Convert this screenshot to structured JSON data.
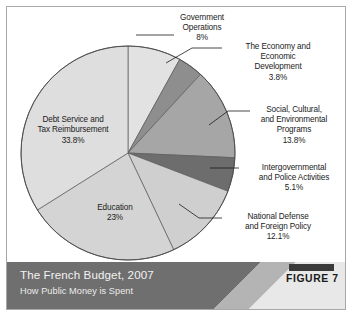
{
  "figure": {
    "title": "The French Budget, 2007",
    "subtitle": "How Public Money is Spent",
    "figure_label": "FIGURE 7"
  },
  "chart_data": {
    "type": "pie",
    "title": "The French Budget, 2007",
    "subtitle": "How Public Money is Spent",
    "legend": "none",
    "grid": false,
    "units": "percent of total budget",
    "categories": [
      "Government Operations",
      "The Economy and Economic Development",
      "Social, Cultural, and Environmental Programs",
      "Intergovernmental and Police Activities",
      "National Defense and Foreign Policy",
      "Education",
      "Debt Service and Tax Reimbursement"
    ],
    "values": [
      8,
      3.8,
      13.8,
      5.1,
      12.1,
      23,
      33.8
    ],
    "value_labels": [
      "8%",
      "3.8%",
      "13.8%",
      "5.1%",
      "12.1%",
      "23%",
      "33.8%"
    ],
    "colors": [
      "#e2e2e2",
      "#8e8e8e",
      "#a6a6a6",
      "#6d6d6d",
      "#cfcfcf",
      "#d4d4d4",
      "#dedede"
    ],
    "slices": [
      {
        "name": "Government Operations",
        "label_lines": "Government\nOperations\n8%",
        "value": 8,
        "value_label": "8%",
        "color": "#e2e2e2",
        "label_placement": "outside-top"
      },
      {
        "name": "The Economy and Economic Development",
        "label_lines": "The Economy and\nEconomic\nDevelopment\n3.8%",
        "value": 3.8,
        "value_label": "3.8%",
        "color": "#8e8e8e",
        "label_placement": "outside-right"
      },
      {
        "name": "Social, Cultural, and Environmental Programs",
        "label_lines": "Social, Cultural,\nand Environmental\nPrograms\n13.8%",
        "value": 13.8,
        "value_label": "13.8%",
        "color": "#a6a6a6",
        "label_placement": "outside-right"
      },
      {
        "name": "Intergovernmental and Police Activities",
        "label_lines": "Intergovernmental\nand Police Activities\n5.1%",
        "value": 5.1,
        "value_label": "5.1%",
        "color": "#6d6d6d",
        "label_placement": "outside-right"
      },
      {
        "name": "National Defense and Foreign Policy",
        "label_lines": "National Defense\nand Foreign Policy\n12.1%",
        "value": 12.1,
        "value_label": "12.1%",
        "color": "#cfcfcf",
        "label_placement": "outside-right"
      },
      {
        "name": "Education",
        "label_lines": "Education\n23%",
        "value": 23,
        "value_label": "23%",
        "color": "#d4d4d4",
        "label_placement": "inside"
      },
      {
        "name": "Debt Service and Tax Reimbursement",
        "label_lines": "Debt Service and\nTax Reimbursement\n33.8%",
        "value": 33.8,
        "value_label": "33.8%",
        "color": "#dedede",
        "label_placement": "inside"
      }
    ]
  }
}
